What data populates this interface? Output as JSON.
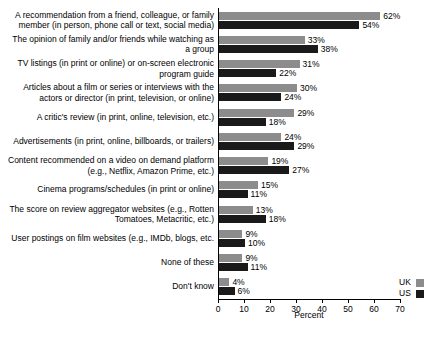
{
  "chart_data": {
    "type": "bar",
    "orientation": "horizontal",
    "title": "",
    "xlabel": "Percent",
    "ylabel": "",
    "xlim": [
      0,
      70
    ],
    "xticks": [
      0,
      10,
      20,
      30,
      40,
      50,
      60,
      70
    ],
    "grid": false,
    "legend_position": "bottom-right",
    "categories": [
      "A recommendation from a friend, colleague, or family member (in person, phone call or text, social media)",
      "The opinion of family and/or friends while watching as a group",
      "TV listings (in print or online) or on-screen electronic program guide",
      "Articles about a film or series or interviews with the actors or director (in print, television, or online)",
      "A critic's review (in print, online, television, etc.)",
      "Advertisements (in print, online, billboards, or trailers)",
      "Content recommended on a video on demand platform (e.g., Netflix, Amazon Prime, etc.)",
      "Cinema programs/schedules (in print or online)",
      "The score on review aggregator websites (e.g., Rotten Tomatoes, Metacritic, etc.)",
      "User postings on film websites (e.g., IMDb, blogs, etc.",
      "None of these",
      "Don't know"
    ],
    "series": [
      {
        "name": "UK",
        "color": "#8c8c8c",
        "values": [
          62,
          33,
          31,
          30,
          29,
          24,
          19,
          15,
          13,
          9,
          9,
          4
        ],
        "labels": [
          "62%",
          "33%",
          "31%",
          "30%",
          "29%",
          "24%",
          "19%",
          "15%",
          "13%",
          "9%",
          "9%",
          "4%"
        ]
      },
      {
        "name": "US",
        "color": "#1a1a1a",
        "values": [
          54,
          38,
          22,
          24,
          18,
          29,
          27,
          11,
          18,
          10,
          11,
          6
        ],
        "labels": [
          "54%",
          "38%",
          "22%",
          "24%",
          "18%",
          "29%",
          "27%",
          "11%",
          "18%",
          "10%",
          "11%",
          "6%"
        ]
      }
    ],
    "xtick_labels": [
      "0",
      "10",
      "20",
      "30",
      "40",
      "50",
      "60",
      "70"
    ]
  }
}
